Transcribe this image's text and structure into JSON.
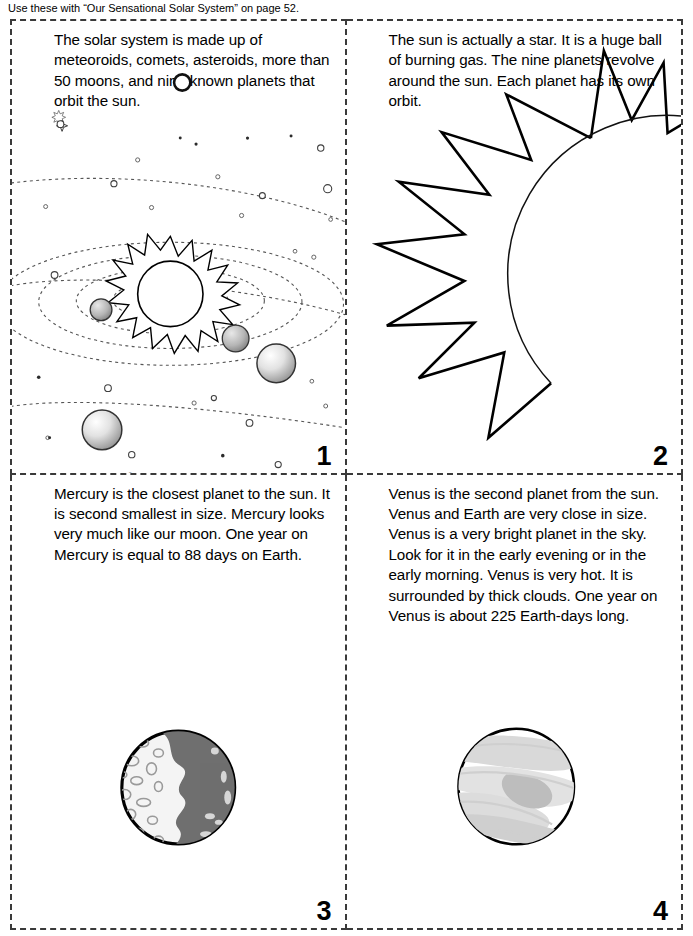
{
  "header": {
    "note": "Use these with “Our Sensational Solar System” on page 52."
  },
  "cards": [
    {
      "number": "1",
      "text": "The solar system is made up of meteoroids, comets, asteroids, more than 50 moons, and nine known planets that orbit the sun.",
      "illustration": "solar-system",
      "copyright": "©1996 The Education Center, Inc."
    },
    {
      "number": "2",
      "text": "The sun is actually a star. It is a huge ball of burning gas. The nine planets revolve around the sun. Each planet has its own orbit.",
      "illustration": "sun"
    },
    {
      "number": "3",
      "text": "Mercury is the closest planet to the sun. It is second smallest in size. Mercury looks very much like our moon. One year on Mercury is equal to 88 days on Earth.",
      "illustration": "mercury"
    },
    {
      "number": "4",
      "text": "Venus is the second planet from the sun. Venus and Earth are very close in size. Venus is a very bright planet in the sky. Look for it in the early evening or in the early morning. Venus is very hot. It is surrounded by thick clouds. One year on Venus is about 225 Earth-days long.",
      "illustration": "venus"
    }
  ],
  "colors": {
    "ink": "#000000",
    "cut_line": "#3a3a3a",
    "orbit_line": "#555555",
    "planet_dark": "#6d6d6d",
    "planet_light": "#f2f2f2",
    "cloud_gray": "#d8d8d8",
    "mercury_shadow": "#6b6b6b",
    "paper": "#ffffff"
  }
}
